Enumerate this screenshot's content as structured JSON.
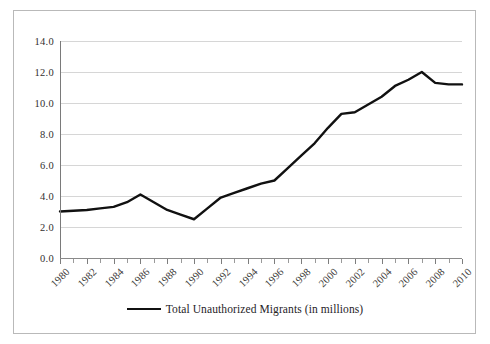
{
  "chart_data": {
    "type": "line",
    "title": "",
    "xlabel": "",
    "ylabel": "",
    "xlim": [
      1980,
      2010
    ],
    "ylim": [
      0.0,
      14.0
    ],
    "ytick_step": 2.0,
    "grid": true,
    "legend_position": "bottom-center",
    "yticks": [
      "0.0",
      "2.0",
      "4.0",
      "6.0",
      "8.0",
      "10.0",
      "12.0",
      "14.0"
    ],
    "ytick_values": [
      0.0,
      2.0,
      4.0,
      6.0,
      8.0,
      10.0,
      12.0,
      14.0
    ],
    "xticks": [
      "1980",
      "1982",
      "1984",
      "1986",
      "1988",
      "1990",
      "1992",
      "1994",
      "1996",
      "1998",
      "2000",
      "2002",
      "2004",
      "2006",
      "2008",
      "2010"
    ],
    "x": [
      1980,
      1981,
      1982,
      1983,
      1984,
      1985,
      1986,
      1987,
      1988,
      1989,
      1990,
      1991,
      1992,
      1993,
      1994,
      1995,
      1996,
      1997,
      1998,
      1999,
      2000,
      2001,
      2002,
      2003,
      2004,
      2005,
      2006,
      2007,
      2008,
      2009,
      2010
    ],
    "series": [
      {
        "name": "Total Unauthorized Migrants (in millions)",
        "color": "#111111",
        "values": [
          3.0,
          3.05,
          3.1,
          3.2,
          3.3,
          3.6,
          4.1,
          3.6,
          3.1,
          2.8,
          2.5,
          3.2,
          3.9,
          4.2,
          4.5,
          4.8,
          5.0,
          5.8,
          6.6,
          7.4,
          8.4,
          9.3,
          9.4,
          9.9,
          10.4,
          11.1,
          11.5,
          12.0,
          11.3,
          11.2,
          11.2
        ]
      }
    ]
  },
  "legend": {
    "label": "Total Unauthorized Migrants (in millions)"
  }
}
